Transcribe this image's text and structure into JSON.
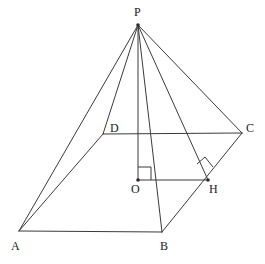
{
  "figure": {
    "kind": "geometry-diagram",
    "canvas": {
      "width": 265,
      "height": 264
    },
    "colors": {
      "background": "#ffffff",
      "stroke": "#3a3a3a",
      "stroke_soft": "#555555",
      "label": "#1a1a1a"
    },
    "vertices": [
      {
        "id": "P",
        "label": "P",
        "x": 138,
        "y": 25,
        "label_x": 134,
        "label_y": 6,
        "dot": true
      },
      {
        "id": "A",
        "label": "A",
        "x": 19,
        "y": 231,
        "label_x": 11,
        "label_y": 240,
        "dot": false
      },
      {
        "id": "B",
        "label": "B",
        "x": 162,
        "y": 232,
        "label_x": 160,
        "label_y": 240,
        "dot": false
      },
      {
        "id": "C",
        "label": "C",
        "x": 242,
        "y": 133,
        "label_x": 246,
        "label_y": 122,
        "dot": false
      },
      {
        "id": "D",
        "label": "D",
        "x": 103,
        "y": 134,
        "label_x": 110,
        "label_y": 122,
        "dot": false
      },
      {
        "id": "O",
        "label": "O",
        "x": 138,
        "y": 180,
        "label_x": 131,
        "label_y": 183,
        "dot": true
      },
      {
        "id": "H",
        "label": "H",
        "x": 208,
        "y": 180,
        "label_x": 209,
        "label_y": 183,
        "dot": true
      }
    ],
    "edges": [
      {
        "id": "PA",
        "from": "P",
        "to": "A",
        "style": "solid"
      },
      {
        "id": "PB",
        "from": "P",
        "to": "B",
        "style": "solid"
      },
      {
        "id": "PC",
        "from": "P",
        "to": "C",
        "style": "solid"
      },
      {
        "id": "PD",
        "from": "P",
        "to": "D",
        "style": "solid"
      },
      {
        "id": "PO",
        "from": "P",
        "to": "O",
        "style": "solid"
      },
      {
        "id": "PH",
        "from": "P",
        "to": "H",
        "style": "solid"
      },
      {
        "id": "AB",
        "from": "A",
        "to": "B",
        "style": "solid"
      },
      {
        "id": "BC",
        "from": "B",
        "to": "C",
        "style": "solid"
      },
      {
        "id": "CD",
        "from": "C",
        "to": "D",
        "style": "solid"
      },
      {
        "id": "DA",
        "from": "D",
        "to": "A",
        "style": "solid"
      },
      {
        "id": "OH",
        "from": "O",
        "to": "H",
        "style": "solid"
      }
    ],
    "right_angles": [
      {
        "id": "angle-at-O",
        "at": "O",
        "note": "PO perpendicular to OH",
        "points": "138,167 151,167 151,180"
      },
      {
        "id": "angle-at-H",
        "at": "H",
        "note": "OH / PH perpendicular to BC",
        "points": "196,165 206,158 214,168"
      }
    ],
    "labels": {
      "P": "P",
      "A": "A",
      "B": "B",
      "C": "C",
      "D": "D",
      "O": "O",
      "H": "H"
    }
  }
}
